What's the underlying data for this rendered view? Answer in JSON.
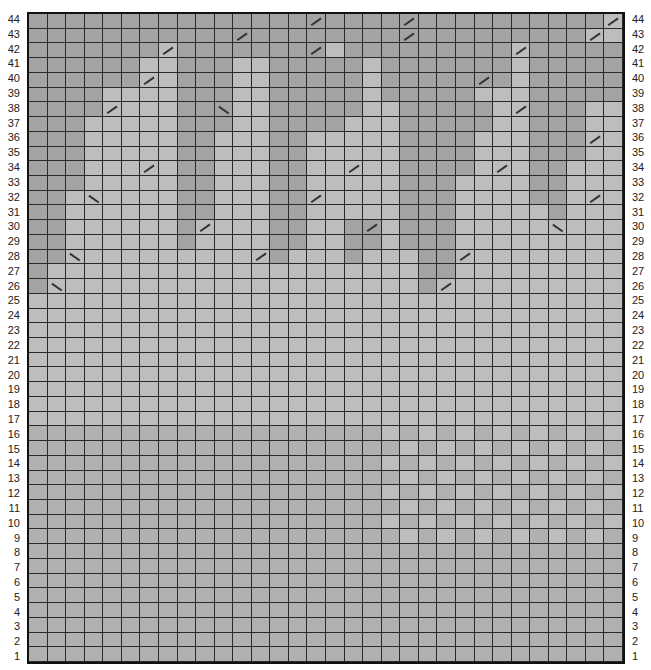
{
  "chart": {
    "columns": 32,
    "rows": 44,
    "legend_codes": {
      "D": "dark",
      "M": "medium",
      "L": "light"
    },
    "colors": {
      "dark": "#a3a3a3",
      "medium": "#b0b0b0",
      "light": "#bdbdbd",
      "gridline": "#2a2a2a",
      "border": "#111111"
    },
    "row_labels_left": [
      "44",
      "43",
      "42",
      "41",
      "40",
      "39",
      "38",
      "37",
      "36",
      "35",
      "34",
      "33",
      "32",
      "31",
      "30",
      "29",
      "28",
      "27",
      "26",
      "25",
      "24",
      "23",
      "22",
      "21",
      "20",
      "19",
      "18",
      "17",
      "16",
      "15",
      "14",
      "13",
      "12",
      "11",
      "10",
      "9",
      "8",
      "7",
      "6",
      "5",
      "4",
      "3",
      "2",
      "1"
    ],
    "row_labels_right": [
      "44",
      "43",
      "42",
      "41",
      "40",
      "39",
      "38",
      "37",
      "36",
      "35",
      "34",
      "33",
      "32",
      "31",
      "30",
      "29",
      "28",
      "27",
      "26",
      "25",
      "24",
      "23",
      "22",
      "21",
      "20",
      "19",
      "18",
      "17",
      "16",
      "15",
      "14",
      "13",
      "12",
      "11",
      "10",
      "9",
      "8",
      "7",
      "6",
      "5",
      "4",
      "3",
      "2",
      "1"
    ],
    "grid_rows": [
      "DDDDDDDDDDDDDDDDDDDDDDDDDDDDDDDL",
      "DDDDDDDDDDDDDDDDDDDDDDDDDDDDDDLL",
      "DDDDDDDLDDDDDDDDLDDDDDDDDDLDDDDD",
      "DDDDDDLLDDDLLDDDDDLDDDDDDDLDDDDD",
      "DDDDDDLLDDDLLDDDDDLDDDDDDDLDDDDD",
      "DDDDLLLLDDDLLDDDDDLDDDDDLLLDDDDD",
      "DDDDLLLLDDDLLDDDDDLLDDDDDLLDDDLL",
      "DDDLLLLLDDDLLDDDDLLLDDDDDLLDDDLL",
      "DDDLLLLLDDLLLDDLLLLLDDDDLLLDDDLL",
      "DDDLLLLLDDLLLDDLLLLLDDDDLLLDDDLL",
      "DDDLLLLLDDLLLDDLLLLLDDDDLLLDDLLL",
      "DDDLLLLLDDLLLDDLLLLLDDDLLLLDDLLL",
      "DDLLLLLLDDLLLDDLLLLLDDDLLLLDDLLL",
      "DDLLLLLLDDLLLDDLLLLLDDDLLLLLDLLL",
      "DDLLLLLLDLLLLDDLLDDLDDDLLLLLLLLL",
      "DDLLLLLLDLLLLDDLLDDLDDDLLLLLLLLL",
      "DDLLLLLLLLLLLDLLLDLLLDDLLLLLLLLL",
      "DLLLLLLLLLLLLLLLLLLLLDDLLLLLLLLL",
      "DLLLLLLLLLLLLLLLLLLLLDLLLLLLLLLL",
      "LLLLLLLLLLLLLLLLLLLLLLLLLLLLLLLL",
      "LLLLLLLLLLLLLLLLLLLLLLLLLLLLLLLL",
      "LLLLLLLLLLLLLLLLLLLLLLLLLLLLLLLL",
      "LLLLLLLLLLLLLLLLLLLLLLLLLLLLLLLL",
      "LLLLLLLLLLLLLLLLLLLLLLLLLLLLLLLL",
      "LLLLLLLLLLLLLLLLLLLLLLLLLLLLLLLL",
      "LLLLLLLLLLLLLLLLLLLLLLLLLLLLLLLL",
      "LLLLLLLLLLLLLLLLLLLLLLLLLLLLLLLL",
      "LLLLLLLLLLLLLLLLLLLLLLLLLLLLLLLL",
      "MMMMMMMMMMMMMMMMMMMLMLMLMLMLMLML",
      "MMMMMMMMMMMMMMMMMMMMLMLMLMLMLMLM",
      "MMMMMMMMMMMMMMMMMMMLMLMLMLMLMLML",
      "MMMMMMMMMMMMMMMMMMMMLMLMLMLMLMLM",
      "MMMMMMMMMMMMMMMMMMMLMLMLMLMLMLML",
      "MMMMMMMMMMMMMMMMMMMMLMLMLMLMLMLM",
      "MMMMMMMMMMMMMMMMMMMLMLMLMLMLMLML",
      "MMMMMMMMMMMMMMMMMMMMLMLMLMLMLMLM",
      "MMMMMMMMMMMMMMMMMMMMMMMMMMMMMMMM",
      "MMMMMMMMMMMMMMMMMMMMMMMMMMMMMMMM",
      "MMMMMMMMMMMMMMMMMMMMMMMMMMMMMMMM",
      "MMMMMMMMMMMMMMMMMMMMMMMMMMMMMMMM",
      "MMMMMMMMMMMMMMMMMMMMMMMMMMMMMMMM",
      "MMMMMMMMMMMMMMMMMMMMMMMMMMMMMMMM",
      "MMMMMMMMMMMMMMMMMMMMMMMMMMMMMMMM",
      "MMMMMMMMMMMMMMMMMMMMMMMMMMMMMMMM"
    ],
    "diagonal_marks": [
      {
        "row": 44,
        "col": 16,
        "dir": "fwd"
      },
      {
        "row": 44,
        "col": 21,
        "dir": "fwd"
      },
      {
        "row": 44,
        "col": 32,
        "dir": "fwd"
      },
      {
        "row": 43,
        "col": 12,
        "dir": "fwd"
      },
      {
        "row": 43,
        "col": 21,
        "dir": "fwd"
      },
      {
        "row": 43,
        "col": 31,
        "dir": "fwd"
      },
      {
        "row": 42,
        "col": 8,
        "dir": "fwd"
      },
      {
        "row": 42,
        "col": 16,
        "dir": "fwd"
      },
      {
        "row": 42,
        "col": 27,
        "dir": "fwd"
      },
      {
        "row": 40,
        "col": 7,
        "dir": "fwd"
      },
      {
        "row": 40,
        "col": 25,
        "dir": "fwd"
      },
      {
        "row": 38,
        "col": 5,
        "dir": "fwd"
      },
      {
        "row": 38,
        "col": 11,
        "dir": "back"
      },
      {
        "row": 38,
        "col": 27,
        "dir": "fwd"
      },
      {
        "row": 36,
        "col": 31,
        "dir": "fwd"
      },
      {
        "row": 34,
        "col": 7,
        "dir": "fwd"
      },
      {
        "row": 34,
        "col": 18,
        "dir": "fwd"
      },
      {
        "row": 34,
        "col": 26,
        "dir": "fwd"
      },
      {
        "row": 32,
        "col": 4,
        "dir": "back"
      },
      {
        "row": 32,
        "col": 16,
        "dir": "fwd"
      },
      {
        "row": 32,
        "col": 31,
        "dir": "fwd"
      },
      {
        "row": 30,
        "col": 10,
        "dir": "fwd"
      },
      {
        "row": 30,
        "col": 19,
        "dir": "fwd"
      },
      {
        "row": 30,
        "col": 29,
        "dir": "back"
      },
      {
        "row": 28,
        "col": 3,
        "dir": "back"
      },
      {
        "row": 28,
        "col": 13,
        "dir": "fwd"
      },
      {
        "row": 28,
        "col": 24,
        "dir": "fwd"
      },
      {
        "row": 26,
        "col": 2,
        "dir": "back"
      },
      {
        "row": 26,
        "col": 23,
        "dir": "fwd"
      }
    ]
  }
}
